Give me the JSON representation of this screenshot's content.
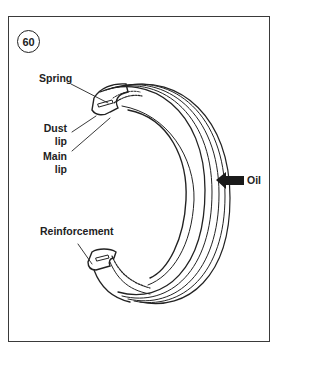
{
  "figure": {
    "number": "60"
  },
  "labels": {
    "spring": "Spring",
    "dust_lip_1": "Dust",
    "dust_lip_2": "lip",
    "main_lip_1": "Main",
    "main_lip_2": "lip",
    "reinforcement": "Reinforcement",
    "oil": "Oil"
  },
  "colors": {
    "line": "#222222",
    "frame": "#3a3a3a",
    "background": "#ffffff"
  }
}
